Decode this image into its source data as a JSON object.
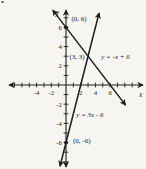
{
  "page": {
    "problem_marker": ".",
    "background": "#f6f5f2",
    "ink_color": "#1e1e1e"
  },
  "chart_data": {
    "type": "line",
    "title": "",
    "xlabel": "x",
    "ylabel": "y",
    "grid": false,
    "legend": "none",
    "xlim": [
      -7.7,
      10.4
    ],
    "ylim": [
      -8.5,
      7.8
    ],
    "x_ticks": [
      -7,
      -6,
      -5,
      -4,
      -3,
      -2,
      -1,
      1,
      2,
      3,
      4,
      5,
      6,
      7,
      8,
      9
    ],
    "x_tick_labels_shown": [
      "-4",
      "-2",
      "2",
      "4",
      "6"
    ],
    "y_ticks": [
      -8,
      -7,
      -6,
      -5,
      -4,
      -3,
      -2,
      -1,
      1,
      2,
      3,
      4,
      5,
      6,
      7
    ],
    "y_tick_labels_shown": [
      "6",
      "4",
      "2",
      "-2",
      "-4",
      "-6"
    ],
    "series": [
      {
        "name": "y = -x + 6",
        "equation": "y = -x + 6",
        "slope": -1,
        "y_intercept": 6,
        "x_draw_range": [
          -1.8,
          8.1
        ]
      },
      {
        "name": "y = 3x - 6",
        "equation": "y = 3x - 6",
        "slope": 3,
        "y_intercept": -6,
        "x_draw_range": [
          -0.82,
          4.5
        ]
      }
    ],
    "intersection_point": {
      "x": 3,
      "y": 3,
      "label": "(3, 3)"
    },
    "marked_points": [
      {
        "label": "(0, 6)",
        "x": 0,
        "y": 6,
        "dot": true
      },
      {
        "label": "(3, 3)",
        "x": 3,
        "y": 3,
        "dot": false
      },
      {
        "label": "(0, -6)",
        "x": 0,
        "y": -6,
        "dot": true
      }
    ],
    "equation_labels": [
      {
        "text": "y = -x + 6",
        "series": "y = -x + 6"
      },
      {
        "text": "y = 3x - 6",
        "series": "y = 3x - 6"
      }
    ]
  }
}
